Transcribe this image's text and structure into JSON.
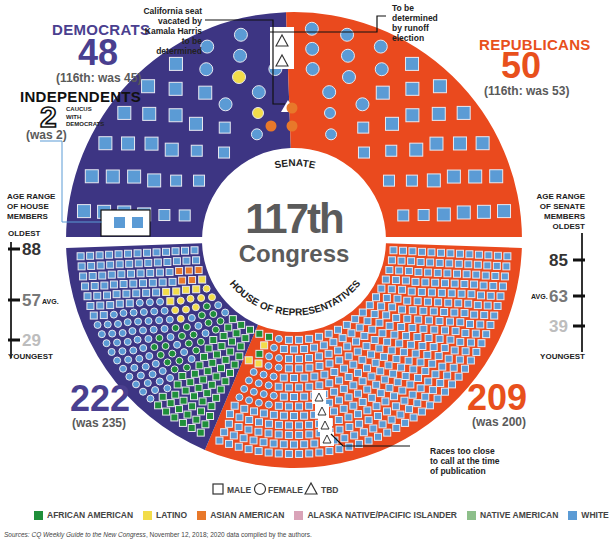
{
  "center": {
    "line1": "117th",
    "line2": "Congress"
  },
  "chamber_labels": {
    "senate": "SENATE",
    "house": "HOUSE OF REPRESENTATIVES"
  },
  "democrats": {
    "title": "DEMOCRATS",
    "senate_count": "48",
    "senate_prev": "(116th: was 45)",
    "house_count": "222",
    "house_prev": "(was 235)"
  },
  "independents": {
    "title": "INDEPENDENTS",
    "count": "2",
    "note_lines": [
      "CAUCUS",
      "WITH",
      "DEMOCRATS"
    ],
    "prev": "(was 2)"
  },
  "republicans": {
    "title": "REPUBLICANS",
    "senate_count": "50",
    "senate_prev": "(116th: was 53)",
    "house_count": "209",
    "house_prev": "(was 200)"
  },
  "annotations": {
    "california": [
      "California seat",
      "vacated by",
      "Kamala Harris",
      "to be determined"
    ],
    "runoff": [
      "To be",
      "determined",
      "by runoff",
      "election"
    ],
    "too_close": [
      "Races too close",
      "to call at the time",
      "of publication"
    ]
  },
  "house_age": {
    "heading": [
      "AGE RANGE",
      "OF HOUSE",
      "MEMBERS"
    ],
    "oldest_label": "OLDEST",
    "youngest_label": "YOUNGEST",
    "oldest": "88",
    "average": "57",
    "avg_label": "AVG.",
    "youngest": "29"
  },
  "senate_age": {
    "heading": [
      "AGE RANGE",
      "OF SENATE",
      "MEMBERS"
    ],
    "oldest_label": "OLDEST",
    "youngest_label": "YOUNGEST",
    "oldest": "85",
    "average": "63",
    "avg_label": "AVG.",
    "youngest": "39"
  },
  "shape_legend": [
    {
      "shape": "square",
      "label": "MALE"
    },
    {
      "shape": "circle",
      "label": "FEMALE"
    },
    {
      "shape": "triangle",
      "label": "TBD"
    }
  ],
  "color_legend": [
    {
      "label": "AFRICAN AMERICAN",
      "color": "#1f8f3a"
    },
    {
      "label": "LATINO",
      "color": "#f2dc4a"
    },
    {
      "label": "ASIAN AMERICAN",
      "color": "#e8782a"
    },
    {
      "label": "ALASKA NATIVE/PACIFIC ISLANDER",
      "color": "#d9a3b8"
    },
    {
      "label": "NATIVE AMERICAN",
      "color": "#8dbf8a"
    },
    {
      "label": "WHITE",
      "color": "#5b9bd5"
    }
  ],
  "colors": {
    "democrat": "#3d3583",
    "republican": "#ea4a1e",
    "democrat_text": "#4a3f8f",
    "republican_text": "#e8501c",
    "center_text": "#5b5b5b"
  },
  "source": {
    "prefix": "Sources: ",
    "italic": "CQ Weekly Guide to the New Congress",
    "rest": ", November 12, 2018; 2020 data compiled by the authors."
  }
}
